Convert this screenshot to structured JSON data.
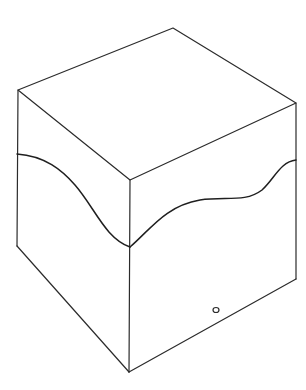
{
  "figure": {
    "caption_fragment": "",
    "colors": {
      "background": "#ffffff",
      "line": "#2b2b2b",
      "wave": "#1f1f1f"
    },
    "vertices": {
      "top": [
        173,
        28
      ],
      "left": [
        18,
        90
      ],
      "right": [
        296,
        103
      ],
      "front": [
        130,
        180
      ],
      "bottom_left": [
        17,
        246
      ],
      "bottom_right": [
        296,
        279
      ],
      "bottom_front": [
        129,
        372
      ]
    },
    "wave_points": {
      "left_face": [
        [
          17,
          154
        ],
        [
          70,
          183
        ],
        [
          100,
          225
        ],
        [
          130,
          247
        ]
      ],
      "right_face": [
        [
          130,
          247
        ],
        [
          195,
          200
        ],
        [
          245,
          198
        ],
        [
          275,
          170
        ],
        [
          296,
          160
        ]
      ]
    },
    "hole": {
      "cx": 216,
      "cy": 310,
      "rx": 3,
      "ry": 2.5
    }
  }
}
